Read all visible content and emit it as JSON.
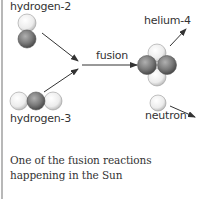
{
  "diagram": {
    "labels": {
      "hydrogen2": "hydrogen-2",
      "hydrogen3": "hydrogen-3",
      "fusion": "fusion",
      "helium4": "helium-4",
      "neutron": "neutron"
    },
    "caption": "One of the fusion reactions happening in the Sun",
    "colors": {
      "proton_light": "#f2f2f2",
      "neutron_dark": "#7a7a7a",
      "arrow": "#333333",
      "border": "#b8b8b8",
      "text": "#333333"
    }
  }
}
